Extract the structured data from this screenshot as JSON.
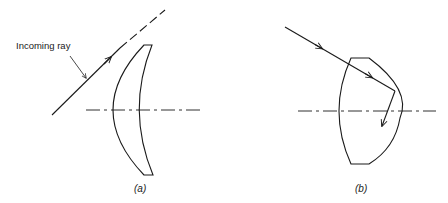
{
  "figure": {
    "panels": [
      {
        "id": "a",
        "caption": "(a)",
        "description": "Meniscus lens with incoming ray passing beside it",
        "annotation": "Incoming ray"
      },
      {
        "id": "b",
        "caption": "(b)",
        "description": "Thick lens with ray refracting through and reflecting off the back surface"
      }
    ],
    "line_color": "#1a1a1a",
    "background": "#ffffff"
  }
}
